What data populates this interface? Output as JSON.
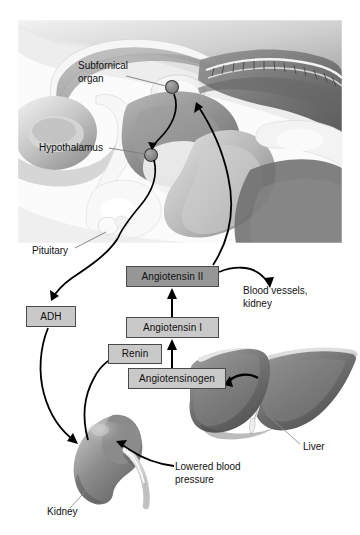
{
  "figure": {
    "background_color": "#ffffff"
  },
  "brain_panel": {
    "name": "midsagittal-brain-illustration",
    "bounds": {
      "x": 18,
      "y": 20,
      "width": 324,
      "height": 223
    },
    "labels": [
      {
        "id": "subfornical_organ",
        "text": "Subfornical\norgan",
        "x": 78,
        "y": 60
      },
      {
        "id": "hypothalamus",
        "text": "Hypothalamus",
        "x": 39,
        "y": 142
      },
      {
        "id": "pituitary",
        "text": "Pituitary",
        "x": 32,
        "y": 245
      }
    ]
  },
  "flowchart": {
    "boxes": [
      {
        "id": "angiotensin_2",
        "label": "Angiotensin II",
        "fill": "#969696",
        "x": 126,
        "y": 266,
        "w": 93,
        "h": 21
      },
      {
        "id": "angiotensin_1",
        "label": "Angiotensin I",
        "fill": "#c9c9c9",
        "x": 126,
        "y": 317,
        "w": 93,
        "h": 21
      },
      {
        "id": "renin",
        "label": "Renin",
        "fill": "#c9c9c9",
        "x": 108,
        "y": 344,
        "w": 54,
        "h": 20
      },
      {
        "id": "angiotensinogen",
        "label": "Angiotensinogen",
        "fill": "#c9c9c9",
        "x": 128,
        "y": 368,
        "w": 98,
        "h": 21
      },
      {
        "id": "adh",
        "label": "ADH",
        "fill": "#c9c9c9",
        "x": 26,
        "y": 306,
        "w": 50,
        "h": 21
      }
    ],
    "target_labels": [
      {
        "id": "blood_vessels_kidney",
        "text": "Blood vessels,\nkidney",
        "x": 243,
        "y": 285
      },
      {
        "id": "lowered_blood_pressure",
        "text": "Lowered blood\npressure",
        "x": 175,
        "y": 461
      }
    ]
  },
  "organs": [
    {
      "id": "kidney",
      "label": "Kidney",
      "label_x": 47,
      "label_y": 506
    },
    {
      "id": "liver",
      "label": "Liver",
      "label_x": 303,
      "label_y": 441
    }
  ],
  "colors": {
    "box_light": "#c9c9c9",
    "box_dark": "#969696",
    "box_border": "#4a4a4a",
    "text": "#111111",
    "arrow": "#000000",
    "leader_line": "#888888",
    "organ_dark": "#6e6e6e",
    "organ_mid": "#8f8f8f",
    "organ_light": "#b8b8b8"
  }
}
